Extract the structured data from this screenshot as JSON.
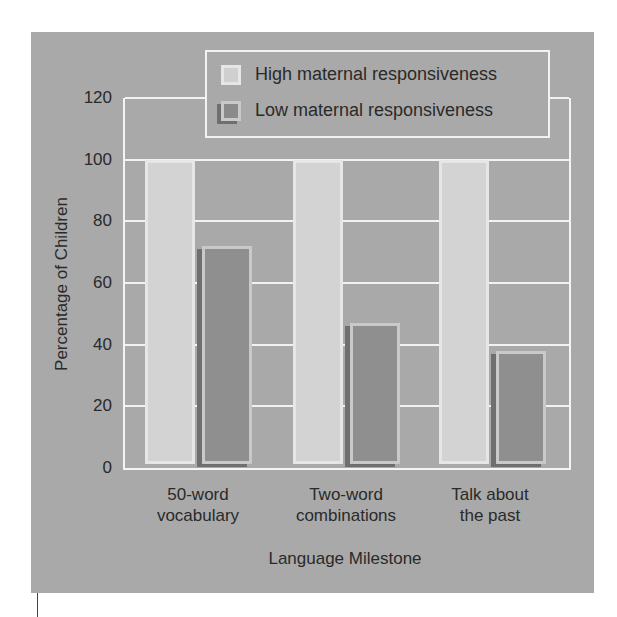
{
  "chart_data": {
    "type": "bar",
    "title": "",
    "xlabel": "Language Milestone",
    "ylabel": "Percentage of Children",
    "ylim": [
      0,
      120
    ],
    "yticks": [
      0,
      20,
      40,
      60,
      80,
      100,
      120
    ],
    "grid": true,
    "legend_position": "top-right",
    "categories": [
      "50-word vocabulary",
      "Two-word combinations",
      "Talk about the past"
    ],
    "category_lines": [
      [
        "50-word",
        "vocabulary"
      ],
      [
        "Two-word",
        "combinations"
      ],
      [
        "Talk about",
        "the past"
      ]
    ],
    "series": [
      {
        "name": "High maternal responsiveness",
        "color": "#d3d3d3",
        "values": [
          100,
          100,
          100
        ]
      },
      {
        "name": "Low maternal responsiveness",
        "color": "#8f8f8f",
        "values": [
          72,
          47,
          38
        ]
      }
    ]
  },
  "legend": {
    "high": "High maternal responsiveness",
    "low": "Low maternal responsiveness"
  },
  "axis": {
    "ylabel": "Percentage of Children",
    "xlabel": "Language Milestone",
    "yticks": [
      "0",
      "20",
      "40",
      "60",
      "80",
      "100",
      "120"
    ]
  },
  "categories": [
    {
      "line1": "50-word",
      "line2": "vocabulary"
    },
    {
      "line1": "Two-word",
      "line2": "combinations"
    },
    {
      "line1": "Talk about",
      "line2": "the past"
    }
  ]
}
